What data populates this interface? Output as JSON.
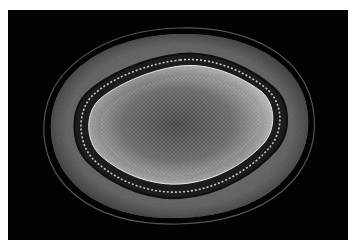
{
  "image": {
    "subject": "plant stem cross-section micrograph",
    "description": "Grayscale light micrograph of a rounded, lobed stem cross-section on a black background showing outer epidermis/cortex rings, a dark vascular ring, and a textured central pith",
    "colors": {
      "border": "#ffffff",
      "background": "#030303",
      "outer_cortex": "#6e6e6e",
      "dark_ring": "#1a1a1a",
      "beaded_ring": "#bdbdbd",
      "inner_band": "#9a9a9a",
      "pith": "#5a5a5a"
    }
  }
}
